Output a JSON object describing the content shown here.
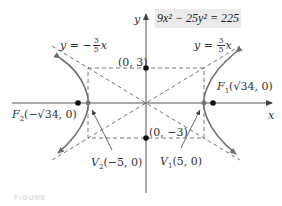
{
  "equation": "9x² − 25y² = 225",
  "axes": {
    "x_label": "x",
    "y_label": "y"
  },
  "asymptotes": {
    "negative": {
      "prefix": "y = −",
      "num": "3",
      "den": "5",
      "suffix": "x"
    },
    "positive": {
      "prefix": "y = ",
      "num": "3",
      "den": "5",
      "suffix": "x"
    }
  },
  "points": {
    "co_vertex_top": "(0, 3)",
    "co_vertex_bottom": "(0, −3)",
    "focus_right": {
      "name": "F",
      "sub": "1",
      "coords": "(√34, 0)"
    },
    "focus_left": {
      "name": "F",
      "sub": "2",
      "coords": "(−√34, 0)"
    },
    "vertex_right": {
      "name": "V",
      "sub": "1",
      "coords": "(5, 0)"
    },
    "vertex_left": {
      "name": "V",
      "sub": "2",
      "coords": "(−5, 0)"
    }
  },
  "caption": "FIGURE",
  "colors": {
    "curve": "#6e6e6e",
    "axis": "#555555",
    "dashed": "#555555",
    "equation_bg": "#ebebeb"
  }
}
